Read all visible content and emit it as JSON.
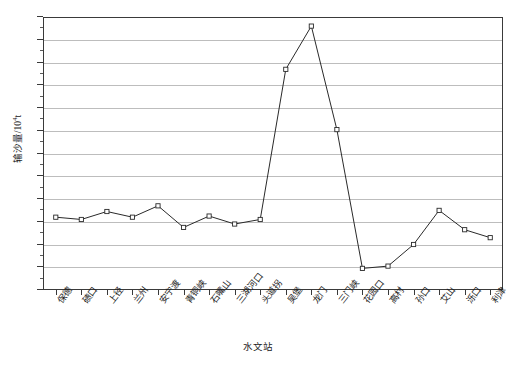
{
  "axes": {
    "y_title": "输沙量/10",
    "y_title_exp": "4",
    "y_title_unit": "t",
    "x_title": "水文站",
    "y_ticks": [
      "9",
      "8",
      "7",
      "6",
      "5",
      "4",
      "3",
      "2",
      "1",
      "0",
      "-1",
      "-2",
      "-3"
    ],
    "y_min": -3,
    "y_max": 9,
    "y_step": 1,
    "y_minor_step": 0.5,
    "grid": "horizontal"
  },
  "chart_data": {
    "type": "line",
    "title": "",
    "xlabel": "水文站",
    "ylabel": "输沙量/10⁴t",
    "ylim": [
      -3,
      9
    ],
    "grid": true,
    "legend": "none",
    "marker": "open-square",
    "categories": [
      "保德",
      "碛口",
      "上径",
      "兰州",
      "安宁渡",
      "青铜峡",
      "石嘴山",
      "三湖河口",
      "头道拐",
      "吴堡",
      "龙门",
      "三门峡",
      "花园口",
      "高村",
      "孙口",
      "艾山",
      "泺口",
      "利津"
    ],
    "values": [
      0.2,
      0.1,
      0.45,
      0.2,
      0.7,
      -0.25,
      0.25,
      -0.1,
      0.1,
      6.7,
      8.6,
      4.05,
      -2.05,
      -1.95,
      -1.0,
      0.5,
      -0.35,
      -0.7
    ]
  }
}
